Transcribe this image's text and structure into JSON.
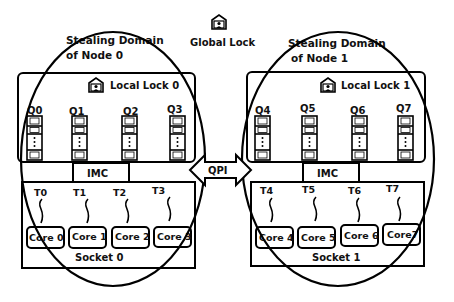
{
  "global_lock": {
    "label": "Global Lock",
    "icon": "lock-icon"
  },
  "interconnect": {
    "label": "QPI"
  },
  "nodes": [
    {
      "domain_label_1": "Stealing Domain",
      "domain_label_2": "of Node 0",
      "local_lock": "Local Lock 0",
      "imc": "IMC",
      "socket": "Socket  0",
      "queues": [
        "Q0",
        "Q1",
        "Q2",
        "Q3"
      ],
      "threads": [
        "T0",
        "T1",
        "T2",
        "T3"
      ],
      "cores": [
        "Core 0",
        "Core 1",
        "Core 2",
        "Core 3"
      ]
    },
    {
      "domain_label_1": "Stealing Domain",
      "domain_label_2": "of Node 1",
      "local_lock": "Local Lock 1",
      "imc": "IMC",
      "socket": "Socket  1",
      "queues": [
        "Q4",
        "Q5",
        "Q6",
        "Q7"
      ],
      "threads": [
        "T4",
        "T5",
        "T6",
        "T7"
      ],
      "cores": [
        "Core 4",
        "Core 5",
        "Core 6",
        "Core7"
      ]
    }
  ]
}
